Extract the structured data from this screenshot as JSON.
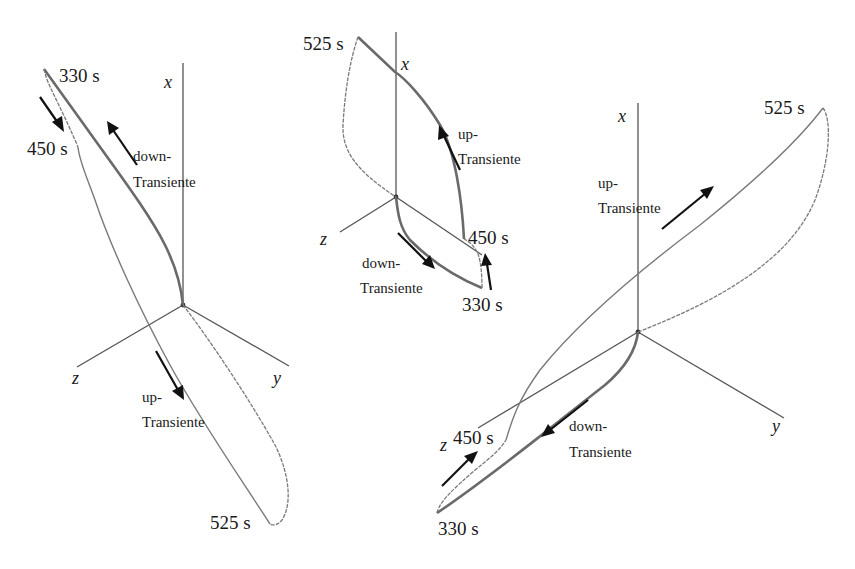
{
  "diagram": {
    "type": "3d-phase-trajectory",
    "panels": [
      {
        "id": "left",
        "axes": {
          "x": "x",
          "y": "y",
          "z": "z"
        },
        "time_labels": [
          "330 s",
          "450 s",
          "525 s"
        ],
        "annotations": [
          {
            "line1": "down-",
            "line2": "Transiente"
          },
          {
            "line1": "up-",
            "line2": "Transiente"
          }
        ]
      },
      {
        "id": "middle",
        "axes": {
          "x": "x",
          "z": "z"
        },
        "time_labels": [
          "525 s",
          "450 s",
          "330 s"
        ],
        "annotations": [
          {
            "line1": "up-",
            "line2": "Transiente"
          },
          {
            "line1": "down-",
            "line2": "Transiente"
          }
        ]
      },
      {
        "id": "right",
        "axes": {
          "x": "x",
          "y": "y",
          "z": "z"
        },
        "time_labels": [
          "525 s",
          "450 s",
          "330 s"
        ],
        "annotations": [
          {
            "line1": "up-",
            "line2": "Transiente"
          },
          {
            "line1": "down-",
            "line2": "Transiente"
          }
        ]
      }
    ]
  }
}
